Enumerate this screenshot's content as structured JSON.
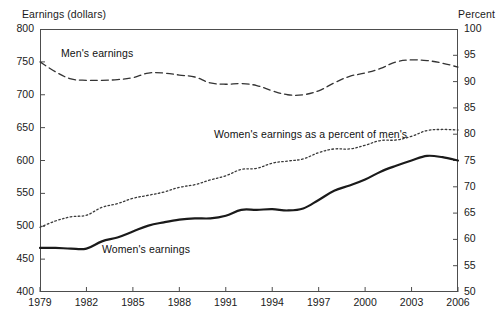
{
  "chart_data": {
    "type": "line",
    "title": "",
    "xlabel": "",
    "ylabel": "Earnings (dollars)",
    "y2label": "Percent",
    "xlim": [
      1979,
      2006
    ],
    "ylim": [
      400,
      800
    ],
    "y2lim": [
      50,
      100
    ],
    "grid": false,
    "legend_position": "inline-annotations",
    "x": [
      1979,
      1980,
      1981,
      1982,
      1983,
      1984,
      1985,
      1986,
      1987,
      1988,
      1989,
      1990,
      1991,
      1992,
      1993,
      1994,
      1995,
      1996,
      1997,
      1998,
      1999,
      2000,
      2001,
      2002,
      2003,
      2004,
      2005,
      2006
    ],
    "x_tick_labels": [
      "1979",
      "1982",
      "1985",
      "1988",
      "1991",
      "1994",
      "1997",
      "2000",
      "2003",
      "2006"
    ],
    "y_tick_labels": [
      "400",
      "450",
      "500",
      "550",
      "600",
      "650",
      "700",
      "750",
      "800"
    ],
    "y2_tick_labels": [
      "50",
      "55",
      "60",
      "65",
      "70",
      "75",
      "80",
      "85",
      "90",
      "95",
      "100"
    ],
    "series": [
      {
        "name": "Men's earnings",
        "axis": "left",
        "style": "dashed",
        "color": "#333333",
        "values": [
          750,
          735,
          724,
          722,
          722,
          723,
          726,
          733,
          733,
          730,
          727,
          718,
          716,
          717,
          714,
          706,
          700,
          700,
          706,
          718,
          728,
          733,
          740,
          750,
          753,
          752,
          748,
          742
        ]
      },
      {
        "name": "Women's earnings",
        "axis": "left",
        "style": "solid",
        "color": "#1a1a1a",
        "values": [
          467,
          467,
          466,
          466,
          477,
          483,
          492,
          501,
          506,
          510,
          512,
          512,
          516,
          525,
          525,
          526,
          524,
          527,
          540,
          554,
          562,
          571,
          583,
          592,
          600,
          607,
          605,
          600
        ]
      },
      {
        "name": "Women's earnings as a percent of men's",
        "axis": "right",
        "style": "dotted",
        "color": "#3a3a3a",
        "values": [
          62.3,
          63.5,
          64.3,
          64.6,
          66.1,
          66.8,
          67.8,
          68.4,
          69.0,
          69.9,
          70.4,
          71.3,
          72.1,
          73.3,
          73.5,
          74.5,
          74.9,
          75.3,
          76.5,
          77.2,
          77.2,
          77.9,
          78.8,
          78.9,
          79.6,
          80.7,
          80.9,
          80.8
        ]
      }
    ]
  },
  "annotations": {
    "mens_label": "Men's earnings",
    "percent_label": "Women's earnings as a percent of men's",
    "womens_label": "Women's earnings"
  },
  "axes": {
    "left_title": "Earnings (dollars)",
    "right_title": "Percent"
  }
}
